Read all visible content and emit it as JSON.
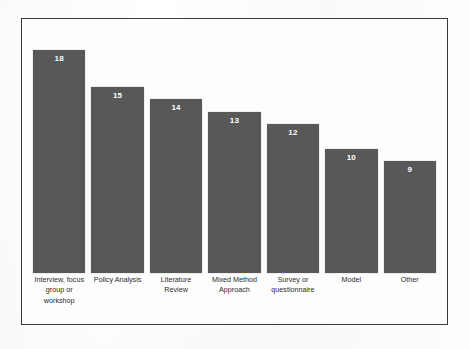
{
  "chart_data": {
    "type": "bar",
    "title": "",
    "subtitle": "",
    "xlabel": "",
    "ylabel": "",
    "categories": [
      "Interview, focus group or workshop",
      "Policy Analysis",
      "Literature Review",
      "Mixed Method Approach",
      "Survey or questionnaire",
      "Model",
      "Other"
    ],
    "values": [
      18,
      15,
      14,
      13,
      12,
      10,
      9
    ],
    "value_labels": [
      "18",
      "15",
      "14",
      "13",
      "12",
      "10",
      "9"
    ],
    "ylim": [
      0,
      20
    ],
    "grid": false,
    "legend": false,
    "legend_position": "none",
    "bar_color": "#585858",
    "value_label_color": "#ffffff",
    "plot_background": "#fdfdfd",
    "frame_border_color": "#3a3a3a"
  }
}
